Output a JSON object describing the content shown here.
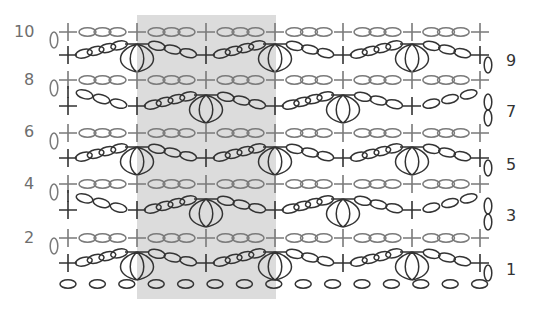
{
  "diagram": {
    "type": "crochet-stitch-chart",
    "shaded_repeat": {
      "x": 137,
      "y": 15,
      "width": 139,
      "height": 284,
      "color": "#dcdcdc"
    },
    "colors": {
      "odd_row": "#333333",
      "even_row": "#7a7a7a"
    },
    "columns_x": [
      68,
      137,
      206,
      275,
      343,
      412,
      480
    ],
    "row_labels": [
      {
        "text": "10",
        "side": "left",
        "x": 14,
        "y": 24,
        "parity": "even"
      },
      {
        "text": "9",
        "side": "right",
        "x": 506,
        "y": 53,
        "parity": "odd"
      },
      {
        "text": "8",
        "side": "left",
        "x": 24,
        "y": 72,
        "parity": "even"
      },
      {
        "text": "7",
        "side": "right",
        "x": 506,
        "y": 104,
        "parity": "odd"
      },
      {
        "text": "6",
        "side": "left",
        "x": 24,
        "y": 124,
        "parity": "even"
      },
      {
        "text": "5",
        "side": "right",
        "x": 506,
        "y": 157,
        "parity": "odd"
      },
      {
        "text": "4",
        "side": "left",
        "x": 24,
        "y": 176,
        "parity": "even"
      },
      {
        "text": "3",
        "side": "right",
        "x": 506,
        "y": 208,
        "parity": "odd"
      },
      {
        "text": "2",
        "side": "left",
        "x": 24,
        "y": 230,
        "parity": "even"
      },
      {
        "text": "1",
        "side": "right",
        "x": 506,
        "y": 262,
        "parity": "odd"
      }
    ],
    "rows": [
      {
        "row": 10,
        "y": 32,
        "parity": "even",
        "kind": "sc-ch3",
        "turn": "left"
      },
      {
        "row": 9,
        "y": 55,
        "parity": "odd",
        "kind": "shell-A",
        "turn": "right"
      },
      {
        "row": 8,
        "y": 80,
        "parity": "even",
        "kind": "sc-ch3",
        "turn": "left"
      },
      {
        "row": 7,
        "y": 106,
        "parity": "odd",
        "kind": "shell-B",
        "turn": "right-up"
      },
      {
        "row": 6,
        "y": 133,
        "parity": "even",
        "kind": "sc-ch3",
        "turn": "left"
      },
      {
        "row": 5,
        "y": 158,
        "parity": "odd",
        "kind": "shell-A",
        "turn": "right"
      },
      {
        "row": 4,
        "y": 184,
        "parity": "even",
        "kind": "sc-ch3",
        "turn": "left"
      },
      {
        "row": 3,
        "y": 210,
        "parity": "odd",
        "kind": "shell-B",
        "turn": "right-up"
      },
      {
        "row": 2,
        "y": 238,
        "parity": "even",
        "kind": "sc-ch3",
        "turn": "left"
      },
      {
        "row": 1,
        "y": 263,
        "parity": "odd",
        "kind": "shell-A",
        "turn": "right"
      }
    ],
    "foundation_chain": {
      "y": 284,
      "count": 15,
      "x_start": 68,
      "x_step": 29.4
    },
    "symbols": {
      "single_crochet": "plus-symbol",
      "chain": "oval-symbol",
      "shell": "fan-cluster-symbol"
    }
  }
}
